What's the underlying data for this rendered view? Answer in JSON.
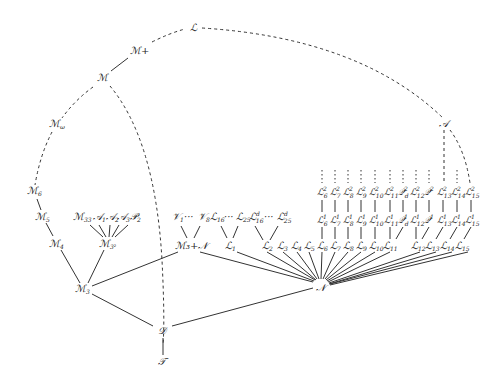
{
  "nodes": {
    "L": {
      "label": "ℒ"
    },
    "Mplus": {
      "label": "ℳ+"
    },
    "M": {
      "label": "ℳ"
    },
    "Momega": {
      "label": "ℳ",
      "sub": "ω"
    },
    "M6": {
      "label": "ℳ",
      "sub": "6"
    },
    "M5": {
      "label": "ℳ",
      "sub": "5"
    },
    "M4": {
      "label": "ℳ",
      "sub": "4"
    },
    "M3": {
      "label": "ℳ",
      "sub": "3"
    },
    "M32": {
      "label": "ℳ",
      "sub": "3²"
    },
    "M33": {
      "label": "ℳ",
      "sub": "33"
    },
    "A1": {
      "label": "𝒜",
      "sub": "1"
    },
    "A2": {
      "label": "𝒜",
      "sub": "2"
    },
    "A3": {
      "label": "𝒜",
      "sub": "3"
    },
    "P2": {
      "label": "𝒫",
      "sub": "2"
    },
    "V1": {
      "label": "𝒱",
      "sub": "1"
    },
    "V8": {
      "label": "𝒱",
      "sub": "8"
    },
    "ellipsis": "···",
    "M3N": {
      "label": "ℳ₃+𝒩"
    },
    "L16": {
      "label": "ℒ",
      "sub": "16"
    },
    "L25": {
      "label": "ℒ",
      "sub": "25"
    },
    "L16d": {
      "label": "ℒ",
      "sup": "d",
      "sub": "16"
    },
    "L25d": {
      "label": "ℒ",
      "sup": "d",
      "sub": "25"
    },
    "L1": {
      "label": "ℒ",
      "sub": "1"
    },
    "N": {
      "label": "𝒩"
    },
    "D": {
      "label": "𝒟"
    },
    "T": {
      "label": "𝒯"
    },
    "A": {
      "label": "𝒜"
    }
  },
  "bottom_row": [
    {
      "label": "ℒ",
      "sub": "2"
    },
    {
      "label": "ℒ",
      "sub": "3"
    },
    {
      "label": "ℒ",
      "sub": "4"
    },
    {
      "label": "ℒ",
      "sub": "5"
    },
    {
      "label": "ℒ",
      "sub": "6"
    },
    {
      "label": "ℒ",
      "sub": "7"
    },
    {
      "label": "ℒ",
      "sub": "8"
    },
    {
      "label": "ℒ",
      "sub": "9"
    },
    {
      "label": "ℒ",
      "sub": "10"
    },
    {
      "label": "ℒ",
      "sub": "11"
    },
    {
      "label": "ℒ",
      "sub": "12"
    },
    {
      "label": "ℒ",
      "sub": "13"
    },
    {
      "label": "ℒ",
      "sub": "14"
    },
    {
      "label": "ℒ",
      "sub": "15"
    }
  ],
  "row1": [
    {
      "label": "ℒ",
      "sup": "1",
      "sub": "6"
    },
    {
      "label": "ℒ",
      "sup": "1",
      "sub": "7"
    },
    {
      "label": "ℒ",
      "sup": "1",
      "sub": "8"
    },
    {
      "label": "ℒ",
      "sup": "1",
      "sub": "9"
    },
    {
      "label": "ℒ",
      "sup": "1",
      "sub": "10"
    },
    {
      "label": "ℒ",
      "sup": "1",
      "sub": "11"
    },
    {
      "label": "𝒬",
      "sup": "1",
      "sub": "d"
    },
    {
      "label": "ℒ",
      "sup": "1",
      "sub": "12"
    },
    {
      "label": "𝒬",
      "sup": "1",
      "sub": ""
    },
    {
      "label": "ℒ",
      "sup": "1",
      "sub": "13"
    },
    {
      "label": "ℒ",
      "sup": "1",
      "sub": "14"
    },
    {
      "label": "ℒ",
      "sup": "1",
      "sub": "15"
    }
  ],
  "row2": [
    {
      "label": "ℒ",
      "sup": "2",
      "sub": "6"
    },
    {
      "label": "ℒ",
      "sup": "2",
      "sub": "7"
    },
    {
      "label": "ℒ",
      "sup": "2",
      "sub": "8"
    },
    {
      "label": "ℒ",
      "sup": "2",
      "sub": "9"
    },
    {
      "label": "ℒ",
      "sup": "2",
      "sub": "10"
    },
    {
      "label": "ℒ",
      "sup": "2",
      "sub": "11"
    },
    {
      "label": "𝒬",
      "sup": "2",
      "sub": "d"
    },
    {
      "label": "ℒ",
      "sup": "2",
      "sub": "12"
    },
    {
      "label": "𝒬",
      "sup": "2",
      "sub": ""
    },
    {
      "label": "ℒ",
      "sup": "2",
      "sub": "13"
    },
    {
      "label": "ℒ",
      "sup": "2",
      "sub": "14"
    },
    {
      "label": "ℒ",
      "sup": "2",
      "sub": "15"
    }
  ]
}
